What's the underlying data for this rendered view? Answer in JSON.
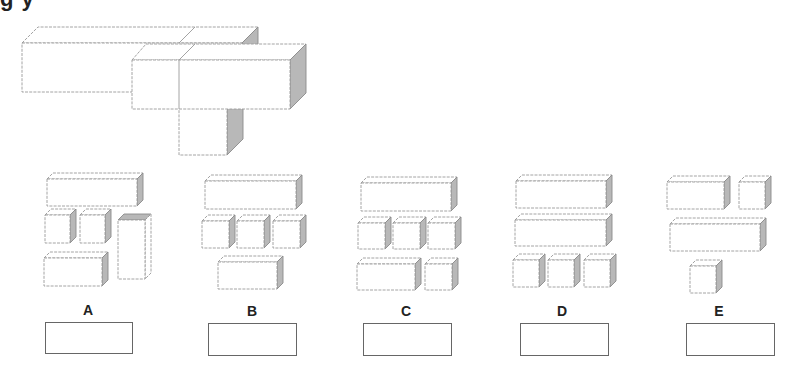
{
  "question": {
    "title_fragment": "g       y",
    "figure": "3D assembled shape made of three rectangular blocks"
  },
  "options": [
    {
      "label": "A",
      "pieces": [
        "long bar",
        "cube",
        "cube",
        "tall upright bar",
        "medium block"
      ]
    },
    {
      "label": "B",
      "pieces": [
        "long bar",
        "cube",
        "cube",
        "cube",
        "medium block"
      ]
    },
    {
      "label": "C",
      "pieces": [
        "long bar",
        "cube",
        "cube",
        "cube",
        "medium block",
        "cube"
      ]
    },
    {
      "label": "D",
      "pieces": [
        "long bar",
        "long bar",
        "cube",
        "cube",
        "cube"
      ]
    },
    {
      "label": "E",
      "pieces": [
        "medium block",
        "cube",
        "long bar",
        "cube"
      ]
    }
  ],
  "answer_boxes": [
    "",
    "",
    "",
    "",
    ""
  ],
  "colors": {
    "line": "#9a9a9a",
    "shade": "#b8b8b8",
    "frame": "#555555"
  }
}
